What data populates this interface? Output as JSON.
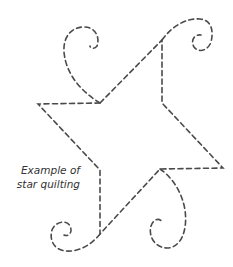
{
  "caption": {
    "line1": "Example of",
    "line2": "star quilting"
  },
  "colors": {
    "stroke": "#4a4a4a",
    "text": "#333333",
    "background": "#ffffff"
  },
  "figure": {
    "type": "star quilting stitch pattern",
    "line_style": "dashed"
  }
}
